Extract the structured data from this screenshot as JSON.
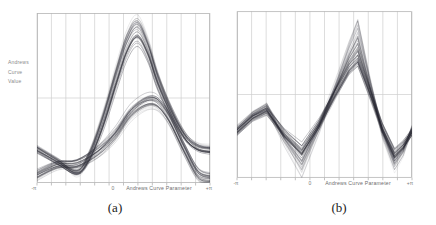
{
  "figure": {
    "background": "#ffffff",
    "captions": {
      "a": "(a)",
      "b": "(b)"
    }
  },
  "style": {
    "curve_color": "#30303a",
    "grid_color": "#cfcfcf",
    "frame_color": "#b5b5b5",
    "tick_color": "#999999",
    "label_color": "#7a7a7a"
  },
  "chart_data": [
    {
      "id": "a",
      "type": "line",
      "subtype": "andrews-curves",
      "caption": "(a)",
      "xlabel": "Andrews Curve Parameter",
      "ylabel_lines": [
        "Andrews",
        "Curve",
        "Value"
      ],
      "x_range": [
        "-π",
        "+π"
      ],
      "y_units": "normalized 0 (bottom) to 1 (top) of plot area; no numeric y ticks shown",
      "xticks": [
        {
          "label": "-π",
          "fx": 0.0
        },
        {
          "label": "0",
          "fx": 0.44
        },
        {
          "label": "+π",
          "fx": 1.0
        }
      ],
      "grid": {
        "v_intervals": 12,
        "h_midline": true
      },
      "smooth": true,
      "clusters": [
        {
          "name": "tall-peak-cluster",
          "n": 32,
          "seed": 7,
          "alpha": 1.0,
          "x": [
            0,
            0.12,
            0.23,
            0.3,
            0.38,
            0.46,
            0.52,
            0.58,
            0.64,
            0.7,
            0.78,
            0.86,
            0.93,
            1.0
          ],
          "v": [
            0.19,
            0.12,
            0.065,
            0.14,
            0.34,
            0.6,
            0.78,
            0.865,
            0.76,
            0.58,
            0.4,
            0.26,
            0.2,
            0.185
          ],
          "amp": [
            0.03,
            0.02,
            -0.02,
            0.02,
            0.05,
            0.08,
            0.1,
            0.105,
            0.09,
            0.06,
            0.03,
            0.02,
            0.025,
            0.03
          ],
          "spread": [
            0.015,
            0.015,
            0.02,
            0.025,
            0.04,
            0.05,
            0.055,
            0.06,
            0.05,
            0.045,
            0.03,
            0.02,
            0.015,
            0.015
          ]
        },
        {
          "name": "low-peak-cluster",
          "n": 28,
          "seed": 13,
          "alpha": 1.05,
          "x": [
            0,
            0.12,
            0.23,
            0.35,
            0.45,
            0.55,
            0.665,
            0.75,
            0.85,
            0.93,
            1.0
          ],
          "v": [
            0.06,
            0.115,
            0.125,
            0.2,
            0.3,
            0.44,
            0.505,
            0.425,
            0.22,
            0.07,
            0.04
          ],
          "amp": [
            -0.025,
            -0.02,
            -0.02,
            -0.03,
            -0.035,
            -0.04,
            -0.045,
            -0.04,
            -0.035,
            -0.03,
            -0.025
          ],
          "spread": [
            0.03,
            0.025,
            0.025,
            0.03,
            0.035,
            0.04,
            0.045,
            0.04,
            0.035,
            0.035,
            0.03
          ]
        }
      ]
    },
    {
      "id": "b",
      "type": "line",
      "subtype": "andrews-curves",
      "caption": "(b)",
      "xlabel": "Andrews Curve Parameter",
      "ylabel_lines": [],
      "x_range": [
        "-π",
        "+π"
      ],
      "y_units": "normalized 0 (bottom) to 1 (top) of plot area; no numeric y ticks shown",
      "xticks": [
        {
          "label": "-π",
          "fx": 0.0
        },
        {
          "label": "0",
          "fx": 0.42
        },
        {
          "label": "+π",
          "fx": 1.0
        }
      ],
      "grid": {
        "v_intervals": 12,
        "h_midline": true
      },
      "smooth": false,
      "clusters": [
        {
          "name": "zigzag-cluster",
          "n": 48,
          "seed": 21,
          "alpha": 0.95,
          "x": [
            0,
            0.09,
            0.17,
            0.27,
            0.37,
            0.47,
            0.56,
            0.64,
            0.69,
            0.76,
            0.83,
            0.9,
            0.95,
            1.0
          ],
          "v": [
            0.27,
            0.36,
            0.4,
            0.27,
            0.18,
            0.33,
            0.5,
            0.64,
            0.69,
            0.5,
            0.3,
            0.15,
            0.2,
            0.27
          ],
          "amp": [
            0.04,
            0.03,
            0.04,
            -0.06,
            -0.17,
            -0.04,
            0.06,
            0.18,
            0.28,
            0.1,
            -0.04,
            -0.1,
            -0.06,
            0.04
          ],
          "spread": [
            0.02,
            0.025,
            0.03,
            0.03,
            0.035,
            0.03,
            0.03,
            0.035,
            0.04,
            0.035,
            0.03,
            0.03,
            0.025,
            0.02
          ]
        }
      ]
    }
  ]
}
